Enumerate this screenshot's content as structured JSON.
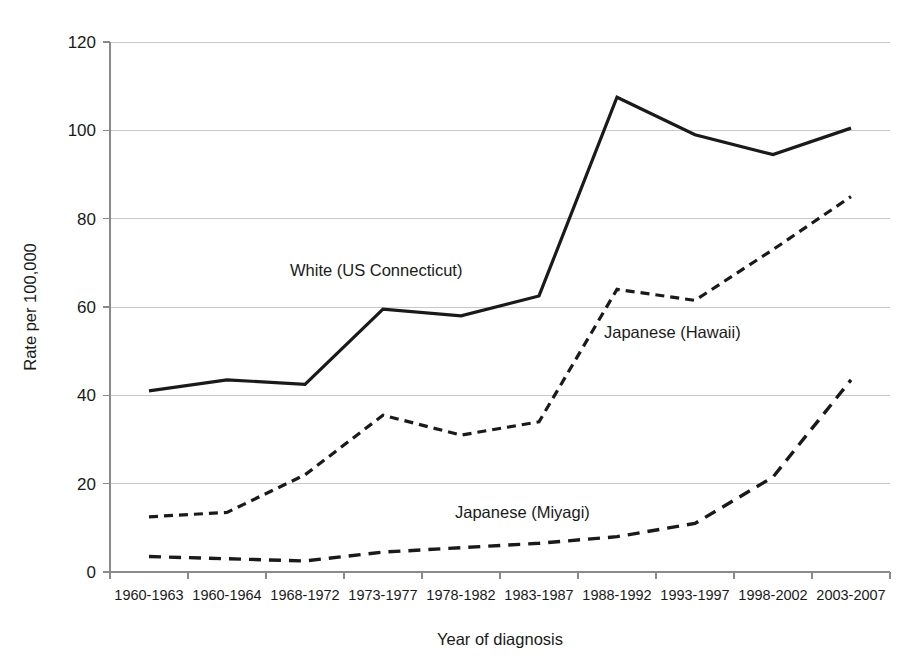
{
  "chart_data": {
    "type": "line",
    "title": "",
    "xlabel": "Year of diagnosis",
    "ylabel": "Rate per 100,000",
    "ylim": [
      0,
      120
    ],
    "ytick_values": [
      0,
      20,
      40,
      60,
      80,
      100,
      120
    ],
    "ytick_labels": [
      "0",
      "20",
      "40",
      "60",
      "80",
      "100",
      "120"
    ],
    "grid": true,
    "legend_position": "inline-annotations",
    "categories": [
      "1960-1963",
      "1960-1964",
      "1968-1972",
      "1973-1977",
      "1978-1982",
      "1983-1987",
      "1988-1992",
      "1993-1997",
      "1998-2002",
      "2003-2007"
    ],
    "series": [
      {
        "name": "White (US Connecticut)",
        "style": "solid",
        "values": [
          41,
          43.5,
          42.5,
          59.5,
          58,
          62.5,
          107.5,
          99,
          94.5,
          100.5
        ]
      },
      {
        "name": "Japanese (Hawaii)",
        "style": "dashed-fine",
        "values": [
          12.5,
          13.5,
          22,
          35.5,
          31,
          34,
          64,
          61.5,
          73,
          85
        ]
      },
      {
        "name": "Japanese (Miyagi)",
        "style": "dashed-coarse",
        "values": [
          3.5,
          3,
          2.5,
          4.5,
          5.5,
          6.5,
          8,
          11,
          21.5,
          43.5
        ]
      }
    ],
    "annotations": [
      {
        "text": "White (US Connecticut)",
        "x": 290,
        "y": 276,
        "anchor": "start"
      },
      {
        "text": "Japanese (Hawaii)",
        "x": 604,
        "y": 338,
        "anchor": "start"
      },
      {
        "text": "Japanese (Miyagi)",
        "x": 455,
        "y": 518,
        "anchor": "start"
      }
    ],
    "colors": {
      "series_line": "#1a1a1a",
      "gridline": "#c9c9c9",
      "axis": "#8a8a8a",
      "background": "#ffffff",
      "text": "#1a1a1a"
    }
  },
  "geometry": {
    "plot_left": 110,
    "plot_right": 890,
    "plot_top": 42,
    "plot_bottom": 572
  }
}
